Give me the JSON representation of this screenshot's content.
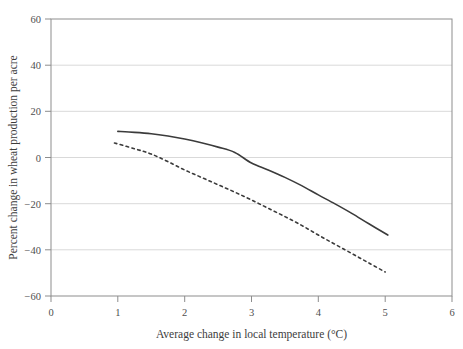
{
  "chart_data": {
    "type": "line",
    "title": "",
    "xlabel": "Average change in local temperature (°C)",
    "ylabel": "Percent change in wheat production per acre",
    "xlim": [
      0,
      6
    ],
    "ylim": [
      -60,
      60
    ],
    "xticks": [
      "0",
      "1",
      "2",
      "3",
      "4",
      "5",
      "6"
    ],
    "xtick_values": [
      0,
      1,
      2,
      3,
      4,
      5,
      6
    ],
    "yticks": [
      "60",
      "40",
      "20",
      "0",
      "−20",
      "−40",
      "−60"
    ],
    "ytick_values": [
      60,
      40,
      20,
      0,
      -20,
      -40,
      -60
    ],
    "grid": "horizontal",
    "legend": "none",
    "series": [
      {
        "name": "solid-line",
        "style": "solid",
        "color": "#3b3b3b",
        "x": [
          1.0,
          1.25,
          1.5,
          1.75,
          2.0,
          2.25,
          2.5,
          2.75,
          3.0,
          3.25,
          3.5,
          3.75,
          4.0,
          4.25,
          4.5,
          4.75,
          5.04
        ],
        "values": [
          11.3,
          10.9,
          10.3,
          9.3,
          8.0,
          6.4,
          4.5,
          2.2,
          -2.4,
          -5.4,
          -8.6,
          -12.2,
          -16.2,
          -20.1,
          -24.2,
          -28.6,
          -33.6
        ]
      },
      {
        "name": "dashed-line",
        "style": "dashed",
        "color": "#3b3b3b",
        "x": [
          0.95,
          1.25,
          1.5,
          1.75,
          2.0,
          2.25,
          2.5,
          2.75,
          3.0,
          3.25,
          3.5,
          3.75,
          4.0,
          4.25,
          4.5,
          4.75,
          5.0
        ],
        "values": [
          6.3,
          3.8,
          1.5,
          -1.8,
          -5.4,
          -8.6,
          -11.8,
          -15.0,
          -18.4,
          -22.0,
          -25.6,
          -29.4,
          -33.6,
          -37.6,
          -41.6,
          -45.6,
          -49.6
        ]
      }
    ]
  }
}
